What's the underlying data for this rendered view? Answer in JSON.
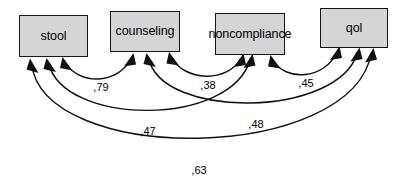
{
  "diagram": {
    "type": "correlation-path-diagram",
    "background_color": "#ffffff",
    "box_fill_color": "#d5d5d5",
    "box_border_color": "#141414",
    "line_color": "#101010",
    "decimal_separator": ",",
    "variables": [
      {
        "id": "stool",
        "label": "stool",
        "x": 19,
        "y": 15,
        "width": 69,
        "height": 42
      },
      {
        "id": "counseling",
        "label": "counseling",
        "x": 110,
        "y": 11,
        "width": 70,
        "height": 41
      },
      {
        "id": "noncompliance",
        "label": "noncompliance",
        "x": 215,
        "y": 13,
        "width": 70,
        "height": 42
      },
      {
        "id": "qol",
        "label": "qol",
        "x": 320,
        "y": 8,
        "width": 68,
        "height": 40
      }
    ],
    "correlations": [
      {
        "id": "stool-counseling",
        "from": "stool",
        "to": "counseling",
        "value": ",79",
        "label_x": 101,
        "label_y": 87
      },
      {
        "id": "counseling-noncompliance",
        "from": "counseling",
        "to": "noncompliance",
        "value": ",38",
        "label_x": 208,
        "label_y": 85
      },
      {
        "id": "noncompliance-qol",
        "from": "noncompliance",
        "to": "qol",
        "value": ",45",
        "label_x": 306,
        "label_y": 83
      },
      {
        "id": "stool-noncompliance",
        "from": "stool",
        "to": "noncompliance",
        "value": ",47",
        "label_x": 148,
        "label_y": 131
      },
      {
        "id": "counseling-qol",
        "from": "counseling",
        "to": "qol",
        "value": ",48",
        "label_x": 256,
        "label_y": 124
      },
      {
        "id": "stool-qol",
        "from": "stool",
        "to": "qol",
        "value": ",63",
        "label_x": 199,
        "label_y": 170
      }
    ]
  }
}
